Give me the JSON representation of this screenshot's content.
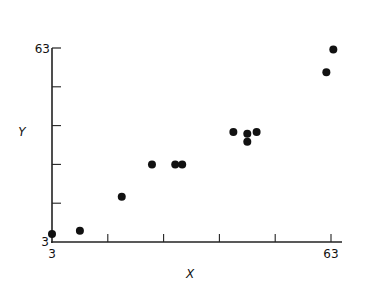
{
  "chart_data": {
    "type": "scatter",
    "title": "",
    "xlabel": "X",
    "ylabel": "Y",
    "xlim": [
      3,
      63
    ],
    "ylim": [
      3,
      63
    ],
    "x_tick_labels": [
      "3",
      "63"
    ],
    "y_tick_labels": [
      "3",
      "63"
    ],
    "x_ticks": [
      3,
      15,
      27,
      39,
      51,
      63
    ],
    "y_ticks": [
      3,
      15,
      27,
      39,
      51,
      63
    ],
    "grid": false,
    "legend": null,
    "points": [
      {
        "x": 3,
        "y": 5.5
      },
      {
        "x": 9,
        "y": 6.5
      },
      {
        "x": 18,
        "y": 17
      },
      {
        "x": 24.5,
        "y": 27
      },
      {
        "x": 29.5,
        "y": 27
      },
      {
        "x": 31,
        "y": 27
      },
      {
        "x": 42,
        "y": 37
      },
      {
        "x": 45,
        "y": 36.5
      },
      {
        "x": 45,
        "y": 34
      },
      {
        "x": 47,
        "y": 37
      },
      {
        "x": 62,
        "y": 55.5
      },
      {
        "x": 63.5,
        "y": 62.5
      }
    ]
  },
  "axes": {
    "x_title": "X",
    "y_title": "Y",
    "x_min_label": "3",
    "x_max_label": "63",
    "y_min_label": "3",
    "y_max_label": "63"
  }
}
